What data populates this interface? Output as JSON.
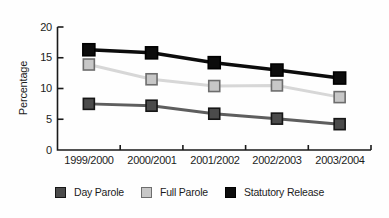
{
  "chart_data": {
    "type": "line",
    "ylabel": "Percentage",
    "xlabel": "",
    "categories": [
      "1999/2000",
      "2000/2001",
      "2001/2002",
      "2002/2003",
      "2003/2004"
    ],
    "series": [
      {
        "name": "Day Parole",
        "values": [
          7.5,
          7.2,
          5.9,
          5.1,
          4.2
        ],
        "line_color": "#5e5e5e",
        "marker_fill": "#4b4b4b",
        "marker_stroke": "#161616"
      },
      {
        "name": "Full Parole",
        "values": [
          13.9,
          11.5,
          10.4,
          10.5,
          8.6
        ],
        "line_color": "#d7d7d7",
        "marker_fill": "#c7c7c7",
        "marker_stroke": "#6d6d6d"
      },
      {
        "name": "Statutory Release",
        "values": [
          16.3,
          15.8,
          14.2,
          13.0,
          11.7
        ],
        "line_color": "#0c0c0c",
        "marker_fill": "#0c0c0c",
        "marker_stroke": "#000000"
      }
    ],
    "yticks": [
      "0",
      "5",
      "10",
      "15",
      "20"
    ],
    "ylim": [
      0,
      20
    ],
    "grid": false,
    "legend_position": "bottom",
    "axis_color": "#1a1a1a"
  }
}
